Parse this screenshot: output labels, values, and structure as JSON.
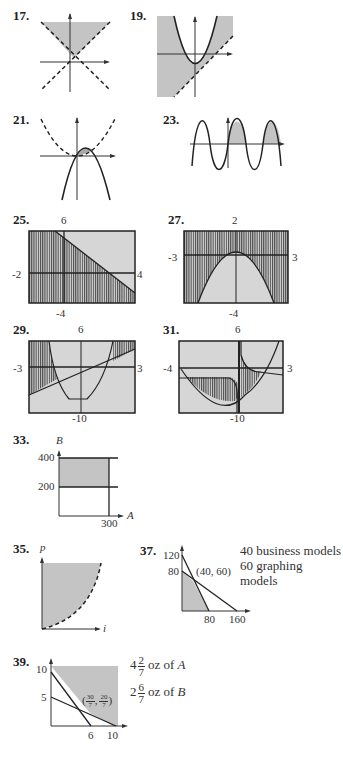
{
  "problems": [
    {
      "number": "17.",
      "graph": "shaded region above two dashed lines forming a V"
    },
    {
      "number": "19.",
      "graph": "shaded region between parabola and dashed line"
    },
    {
      "number": "21.",
      "graph": "small shaded region between dashed upward parabola and solid downward parabola"
    },
    {
      "number": "23.",
      "graph": "sine wave with shaded lobes above x-axis for x>0"
    },
    {
      "number": "25.",
      "graph": "graphing calculator window, shaded below decreasing line",
      "window": {
        "top": "6",
        "bottom": "-4",
        "left": "-2",
        "right": "4"
      }
    },
    {
      "number": "27.",
      "graph": "graphing calculator window, shaded outside downward parabola",
      "window": {
        "top": "2",
        "bottom": "-4",
        "left": "-3",
        "right": "3"
      }
    },
    {
      "number": "29.",
      "graph": "graphing calculator window, shaded between quartic and line",
      "window": {
        "top": "6",
        "bottom": "-10",
        "left": "-3",
        "right": "3"
      }
    },
    {
      "number": "31.",
      "graph": "graphing calculator window, shaded between curve and parabola",
      "window": {
        "top": "6",
        "bottom": "-10",
        "left": "-4",
        "right": "3"
      }
    },
    {
      "number": "33.",
      "axes": {
        "y": "B",
        "x": "A"
      },
      "ticks": {
        "y": [
          "400",
          "200"
        ],
        "x": [
          "300"
        ]
      }
    },
    {
      "number": "35.",
      "axes": {
        "y": "p",
        "x": "i"
      }
    },
    {
      "number": "37.",
      "ticks": {
        "y": [
          "120",
          "80"
        ],
        "x": [
          "80",
          "160"
        ]
      },
      "point": "(40, 60)",
      "answer": [
        "40 business models",
        "60 graphing models"
      ]
    },
    {
      "number": "39.",
      "ticks": {
        "y": [
          "10",
          "5"
        ],
        "x": [
          "6",
          "10"
        ]
      },
      "point": {
        "open": "(",
        "x_num": "30",
        "x_den": "7",
        "sep": ",",
        "y_num": "20",
        "y_den": "7",
        "close": ")"
      },
      "answer": [
        {
          "whole": "4",
          "num": "2",
          "den": "7",
          "text": "oz of",
          "var": "A"
        },
        {
          "whole": "2",
          "num": "6",
          "den": "7",
          "text": "oz of",
          "var": "B"
        }
      ]
    }
  ],
  "colors": {
    "shade": "#c4c4c4",
    "line": "#2a2a2a",
    "calc_bg": "#d6d6d6",
    "calc_hatch": "#4a4a4a"
  }
}
